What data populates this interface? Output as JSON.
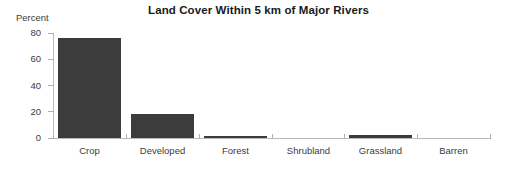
{
  "chart_data": {
    "type": "bar",
    "title": "Land Cover Within 5 km of Major Rivers",
    "xlabel": "",
    "ylabel": "Percent",
    "categories": [
      "Crop",
      "Developed",
      "Forest",
      "Shrubland",
      "Grassland",
      "Barren"
    ],
    "values": [
      76,
      18,
      1,
      0,
      2,
      0
    ],
    "ylim": [
      0,
      80
    ],
    "yticks": [
      0,
      20,
      40,
      60,
      80
    ],
    "ytick_labels": [
      "0",
      "20",
      "40",
      "60",
      "80"
    ],
    "grid": false,
    "legend": "none",
    "bar_color": "#3c3c3c",
    "axis_color": "#b9b9b9",
    "text_color": "#3c3c3c",
    "background": "#ffffff"
  }
}
